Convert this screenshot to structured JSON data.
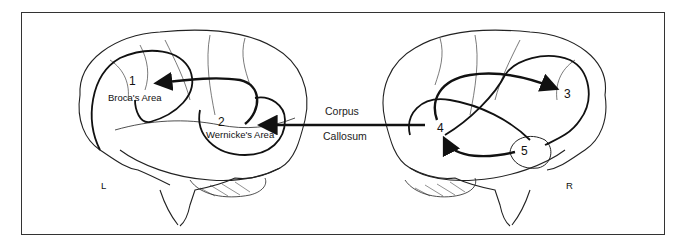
{
  "diagram": {
    "colors": {
      "line": "#111111",
      "background": "#ffffff",
      "frame": "#333333"
    },
    "left_hemisphere": {
      "side_label": "L",
      "areas": [
        {
          "number": "1",
          "name": "Broca's Area"
        },
        {
          "number": "2",
          "name": "Wernicke's Area"
        }
      ]
    },
    "right_hemisphere": {
      "side_label": "R",
      "areas": [
        {
          "number": "3"
        },
        {
          "number": "4"
        },
        {
          "number": "5"
        }
      ]
    },
    "connection": {
      "line1": "Corpus",
      "line2": "Callosum",
      "from": "4",
      "to": "2"
    }
  }
}
